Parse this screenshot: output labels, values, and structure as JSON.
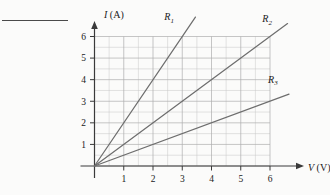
{
  "figure": {
    "type": "physics-iv-characteristic-graph",
    "top_rule": {
      "name": "header-rule",
      "visible": true
    }
  },
  "axes": {
    "x": {
      "label_symbol": "V",
      "label_unit": "(V)",
      "ticks": [
        "1",
        "2",
        "3",
        "4",
        "5",
        "6"
      ],
      "tick_values": [
        1,
        2,
        3,
        4,
        5,
        6
      ],
      "range": [
        0,
        6
      ],
      "minor_step": 0.5
    },
    "y": {
      "label_symbol": "I",
      "label_unit": "(A)",
      "ticks": [
        "1",
        "2",
        "3",
        "4",
        "5",
        "6"
      ],
      "tick_values": [
        1,
        2,
        3,
        4,
        5,
        6
      ],
      "range": [
        0,
        6
      ],
      "minor_step": 0.5
    }
  },
  "colors": {
    "grid": "#b9b9b9",
    "axis": "#3a3a3a",
    "curve": "#6e6e6e",
    "text": "#1a1a1a",
    "background": "#fbfbfa"
  },
  "chart_data": {
    "type": "line",
    "title": "",
    "xlabel": "V (V)",
    "ylabel": "I (A)",
    "xlim": [
      0,
      6
    ],
    "ylim": [
      0,
      6
    ],
    "grid": true,
    "legend_position": "inline-end-of-line",
    "series": [
      {
        "name": "R1",
        "label": "R",
        "subscript": "1",
        "slope": 2.0,
        "x": [
          0,
          3.45
        ],
        "y": [
          0,
          6.9
        ],
        "label_x": 2.55,
        "label_y": 6.75
      },
      {
        "name": "R2",
        "label": "R",
        "subscript": "2",
        "slope": 1.0,
        "x": [
          0,
          6.6
        ],
        "y": [
          0,
          6.6
        ],
        "label_x": 5.9,
        "label_y": 6.65
      },
      {
        "name": "R3",
        "label": "R",
        "subscript": "3",
        "slope": 0.5,
        "x": [
          0,
          6.65
        ],
        "y": [
          0,
          3.33
        ],
        "label_x": 6.1,
        "label_y": 3.85
      }
    ]
  }
}
